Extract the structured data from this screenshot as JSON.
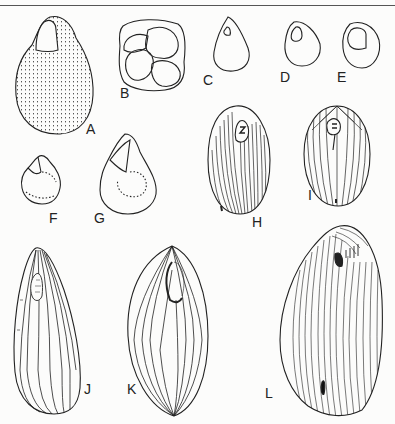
{
  "figure": {
    "panels": [
      {
        "id": "A",
        "label": "A",
        "x": 86,
        "y": 125
      },
      {
        "id": "B",
        "label": "B",
        "x": 120,
        "y": 89
      },
      {
        "id": "C",
        "label": "C",
        "x": 203,
        "y": 70
      },
      {
        "id": "D",
        "label": "D",
        "x": 280,
        "y": 70
      },
      {
        "id": "E",
        "label": "E",
        "x": 337,
        "y": 70
      },
      {
        "id": "F",
        "label": "F",
        "x": 49,
        "y": 212
      },
      {
        "id": "G",
        "label": "G",
        "x": 94,
        "y": 212
      },
      {
        "id": "H",
        "label": "H",
        "x": 252,
        "y": 215
      },
      {
        "id": "I",
        "label": "I",
        "x": 307,
        "y": 188
      },
      {
        "id": "J",
        "label": "J",
        "x": 84,
        "y": 382
      },
      {
        "id": "K",
        "label": "K",
        "x": 127,
        "y": 382
      },
      {
        "id": "L",
        "label": "L",
        "x": 265,
        "y": 386
      }
    ]
  }
}
